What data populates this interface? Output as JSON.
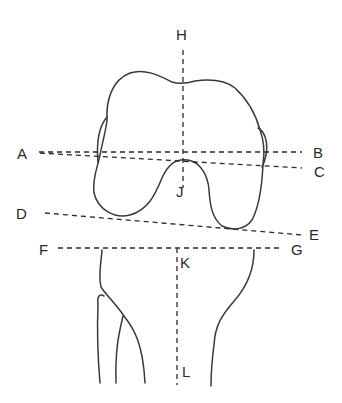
{
  "diagram": {
    "stroke_color": "#3a3a3a",
    "background": "#ffffff",
    "labels": {
      "A": "A",
      "B": "B",
      "C": "C",
      "D": "D",
      "E": "E",
      "F": "F",
      "G": "G",
      "H": "H",
      "J": "J",
      "K": "K",
      "L": "L"
    },
    "lines": [
      {
        "id": "A-B",
        "from": "A",
        "to": "B",
        "style": "dashed",
        "orientation": "horizontal"
      },
      {
        "id": "A-C",
        "from": "A",
        "to": "C",
        "style": "dashed",
        "orientation": "oblique"
      },
      {
        "id": "D-E",
        "from": "D",
        "to": "E",
        "style": "dashed",
        "orientation": "oblique"
      },
      {
        "id": "F-G",
        "from": "F",
        "to": "G",
        "style": "dashed",
        "orientation": "horizontal"
      },
      {
        "id": "H-J",
        "from": "H",
        "to": "J",
        "style": "dashed",
        "orientation": "vertical"
      },
      {
        "id": "K-L",
        "from": "K",
        "to": "L",
        "style": "dashed",
        "orientation": "vertical"
      }
    ]
  }
}
